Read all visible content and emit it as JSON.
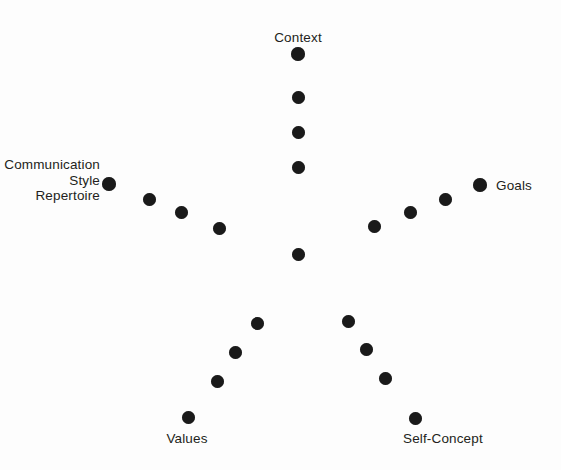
{
  "diagram": {
    "background_color": "#fdfdfd",
    "dot_color": "#1a1a1a",
    "text_color": "#231f20",
    "center": {
      "x": 298,
      "y": 254
    },
    "labels": [
      {
        "id": "context",
        "text": "Context",
        "x": 298,
        "y": 30,
        "align": "center",
        "lines": 1
      },
      {
        "id": "goals",
        "text": "Goals",
        "x": 496,
        "y": 178,
        "align": "right",
        "lines": 1
      },
      {
        "id": "comm-style",
        "text": "Communication\nStyle\nRepertoire",
        "x": 100,
        "y": 157,
        "align": "leftal",
        "lines": 3
      },
      {
        "id": "values",
        "text": "Values",
        "x": 187,
        "y": 431,
        "align": "center",
        "lines": 1
      },
      {
        "id": "self-concept",
        "text": "Self-Concept",
        "x": 403,
        "y": 431,
        "align": "right",
        "lines": 1
      }
    ],
    "arms": [
      {
        "id": "context-arm",
        "label_id": "context",
        "dots": [
          {
            "x": 298,
            "y": 54,
            "d": 14
          },
          {
            "x": 298,
            "y": 97,
            "d": 13
          },
          {
            "x": 298,
            "y": 132,
            "d": 13
          },
          {
            "x": 298,
            "y": 167,
            "d": 13
          },
          {
            "x": 298,
            "y": 254,
            "d": 13
          }
        ]
      },
      {
        "id": "goals-arm",
        "label_id": "goals",
        "dots": [
          {
            "x": 374,
            "y": 226,
            "d": 13
          },
          {
            "x": 410,
            "y": 212,
            "d": 13
          },
          {
            "x": 445,
            "y": 199,
            "d": 13
          },
          {
            "x": 480,
            "y": 185,
            "d": 14
          }
        ]
      },
      {
        "id": "communication-style-arm",
        "label_id": "comm-style",
        "dots": [
          {
            "x": 109,
            "y": 184,
            "d": 14
          },
          {
            "x": 149,
            "y": 199,
            "d": 13
          },
          {
            "x": 181,
            "y": 212,
            "d": 13
          },
          {
            "x": 219,
            "y": 228,
            "d": 13
          }
        ]
      },
      {
        "id": "values-arm",
        "label_id": "values",
        "dots": [
          {
            "x": 257,
            "y": 323,
            "d": 13
          },
          {
            "x": 235,
            "y": 352,
            "d": 13
          },
          {
            "x": 217,
            "y": 381,
            "d": 13
          },
          {
            "x": 188,
            "y": 417,
            "d": 13
          }
        ]
      },
      {
        "id": "self-concept-arm",
        "label_id": "self-concept",
        "dots": [
          {
            "x": 348,
            "y": 321,
            "d": 13
          },
          {
            "x": 366,
            "y": 349,
            "d": 13
          },
          {
            "x": 385,
            "y": 378,
            "d": 13
          },
          {
            "x": 415,
            "y": 418,
            "d": 13
          }
        ]
      }
    ]
  }
}
